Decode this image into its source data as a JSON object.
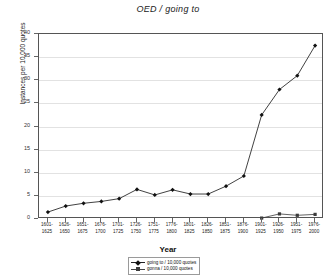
{
  "chart_data": {
    "type": "line",
    "title": "OED / going to",
    "xlabel": "Year",
    "ylabel": "Instances per 10,000 quotes",
    "ylim": [
      0,
      40
    ],
    "yticks": [
      0,
      5,
      10,
      15,
      20,
      25,
      30,
      35,
      40
    ],
    "grid": true,
    "legend_position": "bottom-center",
    "categories": [
      "1601-\n1625",
      "1626-\n1650",
      "1651-\n1675",
      "1676-\n1700",
      "1701-\n1725",
      "1726-\n1750",
      "1751-\n1775",
      "1776-\n1800",
      "1801-\n1825",
      "1826-\n1850",
      "1851-\n1875",
      "1876-\n1900",
      "1901-\n1925",
      "1926-\n1950",
      "1951-\n1975",
      "1976-\n2000"
    ],
    "series": [
      {
        "name": "going to / 10,000 quotes",
        "marker": "diamond",
        "color": "#111111",
        "values": [
          1.5,
          2.8,
          3.4,
          3.8,
          4.4,
          6.4,
          5.2,
          6.3,
          5.4,
          5.4,
          7.1,
          9.3,
          22.5,
          28.0,
          31.0,
          37.5
        ]
      },
      {
        "name": "gonna / 10,000 quotes",
        "marker": "square",
        "color": "#3b3b3b",
        "values": [
          null,
          null,
          null,
          null,
          null,
          null,
          null,
          null,
          null,
          null,
          null,
          null,
          0.2,
          1.1,
          0.8,
          1.0
        ]
      }
    ]
  }
}
